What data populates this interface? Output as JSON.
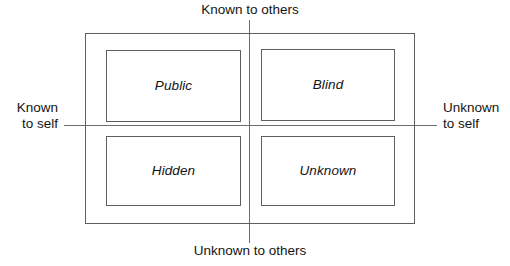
{
  "diagram": {
    "name": "johari-window",
    "type": "quadrant-matrix",
    "axis_labels": {
      "top": "Known to others",
      "bottom": "Unknown to others",
      "left_line1": "Known",
      "left_line2": "to self",
      "right_line1": "Unknown",
      "right_line2": "to self"
    },
    "quadrants": [
      {
        "id": "public",
        "label": "Public",
        "row": "top",
        "column": "left"
      },
      {
        "id": "blind",
        "label": "Blind",
        "row": "top",
        "column": "right"
      },
      {
        "id": "hidden",
        "label": "Hidden",
        "row": "bottom",
        "column": "left"
      },
      {
        "id": "unknown",
        "label": "Unknown",
        "row": "bottom",
        "column": "right"
      }
    ],
    "colors": {
      "line": "#5f5f5f",
      "axis": "#6d6d6d",
      "text": "#141414",
      "background": "#ffffff"
    }
  }
}
